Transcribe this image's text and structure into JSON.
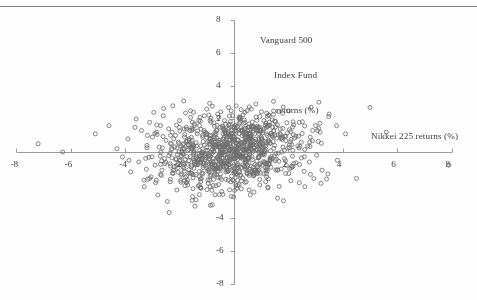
{
  "figure": {
    "background": "#fefefe",
    "marker_color": "#6e6e6e",
    "axis_color": "#9a9a9a",
    "text_color": "#3d3d3d"
  },
  "chart_data": {
    "type": "scatter",
    "title": "",
    "subtitle": "",
    "xlabel": "Nikkei 225 returns (%)",
    "ylabel": "Vanguard 500\nIndex Fund\nreturns (%)",
    "ylabel_lines": [
      "Vanguard 500",
      "Index Fund",
      "returns (%)"
    ],
    "xlim": [
      -8,
      8
    ],
    "ylim": [
      -8,
      8
    ],
    "xticks": [
      -8,
      -6,
      -4,
      -2,
      2,
      4,
      6,
      8
    ],
    "yticks": [
      -8,
      -6,
      -4,
      2,
      4,
      6,
      8
    ],
    "xtick_labels": [
      "-8",
      "-6",
      "-4",
      "-2",
      "2",
      "4",
      "6",
      "8"
    ],
    "ytick_labels": [
      "-8",
      "-6",
      "-4",
      "2",
      "4",
      "6",
      "8"
    ],
    "grid": false,
    "legend": null,
    "axes_style": "crossed-at-origin",
    "marker": "open-circle",
    "marker_size_px": 4,
    "n_points": 1000,
    "series": [
      {
        "name": "Daily returns",
        "x": [
          -6.3,
          -7.2,
          -5.1,
          -4.6,
          -4.3,
          -4.1,
          -3.9,
          -3.8,
          -3.6,
          -3.5,
          -3.4,
          -3.3,
          -3.2,
          -3.1,
          -3.05,
          -3.0,
          -2.95,
          -2.9,
          -2.85,
          -2.8,
          -2.75,
          -2.7,
          -2.65,
          -2.6,
          -2.55,
          -2.5,
          -2.45,
          -2.4,
          -2.35,
          -2.3,
          -2.25,
          -2.2,
          -2.15,
          -2.1,
          -2.05,
          -2.0,
          -1.95,
          -1.9,
          -1.85,
          -1.8,
          -1.75,
          -1.7,
          -1.65,
          -1.6,
          -1.55,
          -1.5,
          -1.45,
          -1.4,
          -1.35,
          -1.3,
          -1.25,
          -1.2,
          -1.15,
          -1.1,
          -1.05,
          -1.0,
          -0.95,
          -0.9,
          -0.85,
          -0.8,
          -0.75,
          -0.7,
          -0.65,
          -0.6,
          -0.55,
          -0.5,
          -0.45,
          -0.4,
          -0.35,
          -0.3,
          -0.25,
          -0.2,
          -0.15,
          -0.1,
          -0.05,
          0.0,
          0.05,
          0.1,
          0.15,
          0.2,
          0.25,
          0.3,
          0.35,
          0.4,
          0.45,
          0.5,
          0.55,
          0.6,
          0.65,
          0.7,
          0.75,
          0.8,
          0.85,
          0.9,
          0.95,
          1.0,
          1.1,
          1.2,
          1.3,
          1.4,
          1.5,
          1.6,
          1.7,
          1.8,
          1.9,
          2.0,
          2.2,
          2.4,
          2.6,
          2.8,
          3.0,
          3.2,
          3.5,
          3.8,
          4.1,
          4.5,
          5.0,
          5.6,
          7.9
        ],
        "y": [
          0.0,
          0.5,
          1.1,
          1.6,
          0.2,
          -0.3,
          0.8,
          -1.2,
          2.0,
          -0.6,
          1.3,
          -2.1,
          0.4,
          1.8,
          -1.5,
          0.9,
          2.4,
          -0.8,
          1.2,
          -2.6,
          0.3,
          1.6,
          -1.1,
          2.2,
          -0.4,
          0.7,
          -3.0,
          1.4,
          -1.8,
          0.5,
          2.8,
          -0.9,
          1.0,
          -2.3,
          0.6,
          1.9,
          -1.4,
          0.2,
          3.1,
          -0.7,
          1.5,
          -2.0,
          0.8,
          2.5,
          -1.3,
          0.4,
          1.7,
          -2.9,
          1.1,
          -0.5,
          2.1,
          -1.6,
          0.9,
          1.3,
          -0.2,
          2.6,
          -1.9,
          0.6,
          1.8,
          -3.2,
          0.3,
          1.2,
          -1.0,
          2.3,
          -0.6,
          1.5,
          -2.4,
          0.8,
          1.9,
          -1.2,
          0.5,
          2.7,
          -0.9,
          1.1,
          -1.7,
          0.2,
          1.6,
          -2.2,
          0.7,
          2.0,
          -1.4,
          1.3,
          -0.3,
          2.4,
          -1.8,
          0.9,
          1.7,
          -2.6,
          0.4,
          1.2,
          -1.1,
          2.9,
          -0.8,
          1.5,
          -2.0,
          0.6,
          1.9,
          -1.5,
          2.2,
          -0.4,
          1.0,
          -2.8,
          1.4,
          0.3,
          -1.3,
          2.5,
          -0.7,
          1.8,
          -2.1,
          0.9,
          1.6,
          -1.9,
          2.3,
          -0.5,
          1.1,
          -1.6,
          2.7,
          1.2,
          -0.8
        ]
      }
    ],
    "cluster": {
      "center_x": 0.0,
      "center_y": 0.0,
      "sd_x": 1.25,
      "sd_y": 1.15,
      "correlation": 0.22
    }
  }
}
